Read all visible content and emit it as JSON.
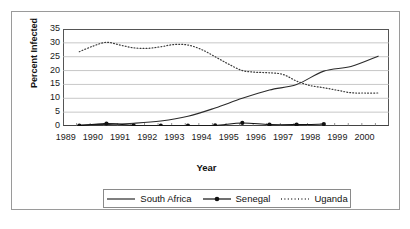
{
  "chart_data": {
    "type": "line",
    "title": "",
    "xlabel": "Year",
    "ylabel": "Percent Infected",
    "xlim": [
      1989,
      2001
    ],
    "ylim": [
      0,
      35
    ],
    "yticks": [
      0,
      5,
      10,
      15,
      20,
      25,
      30,
      35
    ],
    "xticks": [
      1989,
      1990,
      1991,
      1992,
      1993,
      1994,
      1995,
      1996,
      1997,
      1998,
      1999,
      2000
    ],
    "grid": "horizontal",
    "legend_position": "bottom",
    "series": [
      {
        "name": "South Africa",
        "style": "solid",
        "marker": "none",
        "color": "#2b2b2b",
        "x": [
          1989.6,
          1990.6,
          1991.6,
          1992.6,
          1993.6,
          1994.6,
          1995.6,
          1996.6,
          1997.6,
          1998.6,
          1999.6,
          2000.6
        ],
        "values": [
          0.3,
          0.6,
          1.0,
          1.8,
          3.5,
          6.5,
          10.0,
          13.0,
          15.0,
          19.8,
          21.5,
          25.2
        ]
      },
      {
        "name": "Senegal",
        "style": "solid",
        "marker": "filled-circle",
        "color": "#111111",
        "x": [
          1989.6,
          1990.6,
          1991.6,
          1992.6,
          1993.6,
          1994.6,
          1995.6,
          1996.6,
          1997.6,
          1998.6
        ],
        "values": [
          0.1,
          0.9,
          0.2,
          0.1,
          0.1,
          0.2,
          1.1,
          0.5,
          0.5,
          0.7
        ]
      },
      {
        "name": "Uganda",
        "style": "dotted",
        "marker": "none",
        "color": "#3a3a3a",
        "x": [
          1989.6,
          1990.1,
          1990.6,
          1991.1,
          1991.6,
          1992.1,
          1992.6,
          1993.1,
          1993.6,
          1994.1,
          1994.6,
          1995.1,
          1995.6,
          1996.1,
          1996.6,
          1997.1,
          1997.6,
          1998.1,
          1998.6,
          1999.1,
          1999.6,
          2000.1,
          2000.6
        ],
        "values": [
          26.8,
          28.8,
          30.2,
          29.2,
          28.2,
          28.0,
          28.6,
          29.4,
          29.2,
          27.6,
          25.0,
          22.3,
          20.0,
          19.4,
          19.2,
          18.6,
          16.2,
          14.6,
          13.8,
          12.9,
          12.0,
          11.9,
          11.9
        ]
      }
    ]
  },
  "legend": {
    "items": [
      {
        "label": "South Africa",
        "key": "solid-line-key"
      },
      {
        "label": "Senegal",
        "key": "line-marker-key"
      },
      {
        "label": "Uganda",
        "key": "dotted-line-key"
      }
    ]
  }
}
